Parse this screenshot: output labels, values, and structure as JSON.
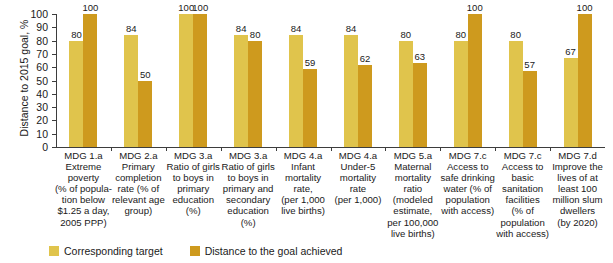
{
  "chart_data": {
    "type": "bar",
    "title": "",
    "subtitle": "",
    "xlabel": "",
    "ylabel": "Distance to 2015 goal, %",
    "ylim": [
      0,
      100
    ],
    "ytick_values": [
      0,
      10,
      20,
      30,
      40,
      50,
      60,
      70,
      80,
      90,
      100
    ],
    "ytick_labels": [
      "0",
      "10",
      "20",
      "30",
      "40",
      "50",
      "60",
      "70",
      "80",
      "90",
      "100"
    ],
    "grid": false,
    "legend_position": "bottom-left",
    "categories": [
      "MDG 1.a\nExtreme\npoverty\n(% of popula-\ntion below\n$1.25 a day,\n2005 PPP)",
      "MDG 2.a\nPrimary\ncompletion\nrate (% of\nrelevant age\ngroup)",
      "MDG 3.a\nRatio of girls\nto boys in\nprimary\neducation\n(%)",
      "MDG 3.a\nRatio of girls\nto boys in\nprimary and\nsecondary\neducation\n(%)",
      "MDG 4.a\nInfant\nmortality\nrate,\n(per 1,000\nlive births)",
      "MDG 4.a\nUnder-5\nmortality\nrate\n(per 1,000)",
      "MDG 5.a\nMaternal\nmortality\nratio\n(modeled\nestimate,\nper 100,000\nlive births)",
      "MDG 7.c\nAccess to\nsafe drinking\nwater (% of\npopulation\nwith access)",
      "MDG 7.c\nAccess to\nbasic\nsanitation\nfacilities\n(% of\npopulation\nwith access)",
      "MDG 7.d\nImprove the\nlives of at\nleast 100\nmillion slum\ndwellers\n(by 2020)"
    ],
    "series": [
      {
        "name": "Corresponding target",
        "color": "#e0c44c",
        "values": [
          80,
          84,
          100,
          84,
          84,
          84,
          80,
          80,
          80,
          67
        ]
      },
      {
        "name": "Distance to the goal achieved",
        "color": "#ce9a1e",
        "values": [
          100,
          50,
          100,
          80,
          59,
          62,
          63,
          100,
          57,
          100
        ]
      }
    ]
  },
  "legend": {
    "items": [
      {
        "label": "Corresponding target",
        "color": "#e0c44c"
      },
      {
        "label": "Distance to the goal achieved",
        "color": "#ce9a1e"
      }
    ]
  },
  "colors": {
    "target": "#e0c44c",
    "achieved": "#ce9a1e",
    "axis": "#3d3d3d",
    "text": "#1a1a1a",
    "background": "#ffffff"
  }
}
